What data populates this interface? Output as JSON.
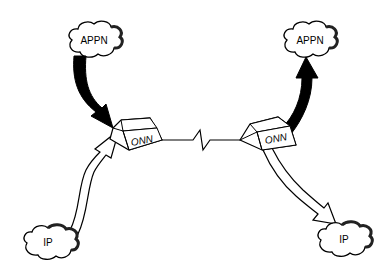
{
  "diagram": {
    "nodes": [
      {
        "id": "appn-left",
        "type": "cloud",
        "label": "APPN"
      },
      {
        "id": "appn-right",
        "type": "cloud",
        "label": "APPN"
      },
      {
        "id": "onn-left",
        "type": "box",
        "label": "ONN"
      },
      {
        "id": "onn-right",
        "type": "box",
        "label": "ONN"
      },
      {
        "id": "ip-left",
        "type": "cloud",
        "label": "IP"
      },
      {
        "id": "ip-right",
        "type": "cloud",
        "label": "IP"
      }
    ],
    "edges": [
      {
        "from": "appn-left",
        "to": "onn-left",
        "style": "solid-black-arrow"
      },
      {
        "from": "onn-right",
        "to": "appn-right",
        "style": "solid-black-arrow"
      },
      {
        "from": "ip-left",
        "to": "onn-left",
        "style": "hollow-arrow"
      },
      {
        "from": "onn-right",
        "to": "ip-right",
        "style": "hollow-arrow"
      },
      {
        "from": "onn-left",
        "to": "onn-right",
        "style": "zigzag-link"
      }
    ],
    "colors": {
      "stroke": "#000000",
      "fill": "#ffffff",
      "shadow": "#333333"
    }
  }
}
